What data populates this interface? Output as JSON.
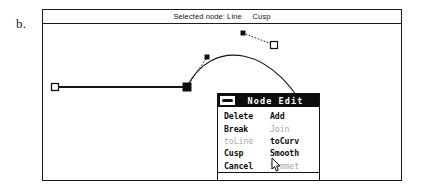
{
  "figure": {
    "label": "b."
  },
  "window": {
    "status_bar": {
      "text": "Selected node: Line     Cusp",
      "selected_node_label": "Selected node:",
      "node_type": "Line",
      "node_mode": "Cusp"
    }
  },
  "dialog": {
    "title": "Node Edit",
    "close_box_icon": "close-box-icon",
    "rows": [
      {
        "left": {
          "label": "Delete",
          "hotkey": "D",
          "enabled": true
        },
        "right": {
          "label": "Add",
          "hotkey": "A",
          "enabled": true
        }
      },
      {
        "left": {
          "label": "Break",
          "hotkey": "B",
          "enabled": true
        },
        "right": {
          "label": "Join",
          "hotkey": "J",
          "enabled": false
        }
      },
      {
        "left": {
          "label": "toLine",
          "hotkey": "L",
          "enabled": false
        },
        "right": {
          "label": "toCurv",
          "hotkey": "t",
          "enabled": true
        }
      },
      {
        "left": {
          "label": "Cusp",
          "hotkey": "C",
          "enabled": true
        },
        "right": {
          "label": "Smooth",
          "hotkey": "m",
          "enabled": true
        }
      },
      {
        "left": {
          "label": "Cancel",
          "hotkey": "",
          "enabled": true
        },
        "right": {
          "label": "Symmet",
          "hotkey": "y",
          "enabled": false
        }
      }
    ]
  },
  "canvas": {
    "description": "Bezier path editing canvas with straight segment and curve segment",
    "colors": {
      "stroke": "#151515",
      "background": "#ffffff",
      "handle_line": "#333333"
    },
    "path_segments": [
      {
        "type": "line",
        "from": [
          12,
          63
        ],
        "to": [
          144,
          63
        ]
      },
      {
        "type": "curve",
        "from": [
          144,
          63
        ],
        "control1": [
          166,
          16
        ],
        "control2": [
          232,
          14
        ],
        "to": [
          272,
          105
        ]
      }
    ],
    "nodes": [
      {
        "name": "endpoint-left",
        "x": 12,
        "y": 63,
        "style": "open-square",
        "selected": false
      },
      {
        "name": "node-selected-cusp",
        "x": 144,
        "y": 63,
        "style": "filled-square",
        "selected": true
      },
      {
        "name": "node-mid-open",
        "x": 231,
        "y": 21,
        "style": "open-square",
        "selected": false
      },
      {
        "name": "endpoint-right",
        "x": 272,
        "y": 105,
        "style": "open-square",
        "selected": false
      }
    ],
    "control_handles": [
      {
        "name": "handle-left",
        "anchor": [
          144,
          63
        ],
        "point": [
          164,
          33
        ],
        "style": "filled-dot"
      },
      {
        "name": "handle-right",
        "anchor": [
          231,
          21
        ],
        "point": [
          200,
          9
        ],
        "style": "filled-dot"
      }
    ]
  },
  "cursor": {
    "name": "arrow-cursor",
    "x": 228,
    "y": 148
  }
}
